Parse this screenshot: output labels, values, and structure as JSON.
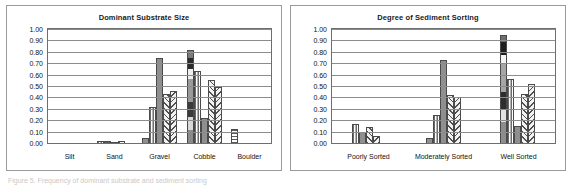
{
  "page": {
    "background_color": "#ffffff",
    "caption_partial": "Figure 5. Frequency of dominant substrate and sediment sorting"
  },
  "axis": {
    "ticks": [
      "1.00",
      "0.90",
      "0.80",
      "0.70",
      "0.60",
      "0.50",
      "0.40",
      "0.30",
      "0.20",
      "0.10",
      "0.00"
    ],
    "ymin": 0.0,
    "ymax": 1.0,
    "step": 0.1,
    "grid": true
  },
  "colors": {
    "frame": "#9a9a9a",
    "plot_border": "#6e6e6e",
    "gridline": "#8c8c8c",
    "bar_outline": "#4a4a4a",
    "text": "#111111"
  },
  "chart_data": [
    {
      "type": "bar",
      "panel": "left",
      "title": "Dominant Substrate Size",
      "xlabel": "",
      "ylabel": "",
      "ylim": [
        0,
        1.0
      ],
      "ytick_labels": [
        "1.00",
        "0.90",
        "0.80",
        "0.70",
        "0.60",
        "0.50",
        "0.40",
        "0.30",
        "0.20",
        "0.10",
        "0.00"
      ],
      "grid": true,
      "legend": "none",
      "categories": [
        "Silt",
        "Sand",
        "Gravel",
        "Cobble",
        "Boulder"
      ],
      "groups": [
        {
          "category": "Silt",
          "bars": [
            {
              "value": 0.0,
              "pattern": "p-solid"
            },
            {
              "value": 0.0,
              "pattern": "p-vstripe"
            },
            {
              "value": 0.0,
              "pattern": "p-diagR"
            },
            {
              "value": 0.0,
              "pattern": "p-diagL"
            },
            {
              "value": 0.0,
              "pattern": "p-solid"
            }
          ]
        },
        {
          "category": "Sand",
          "bars": [
            {
              "value": 0.015,
              "pattern": "p-vstripe"
            },
            {
              "value": 0.015,
              "pattern": "p-hstripe"
            },
            {
              "value": 0.01,
              "pattern": "p-solid"
            },
            {
              "value": 0.015,
              "pattern": "p-diagR"
            },
            {
              "value": 0.0,
              "pattern": "p-solid"
            }
          ]
        },
        {
          "category": "Gravel",
          "bars": [
            {
              "value": 0.04,
              "pattern": "p-solid"
            },
            {
              "value": 0.32,
              "pattern": "p-vstripe"
            },
            {
              "value": 0.75,
              "pattern": "p-solid"
            },
            {
              "value": 0.43,
              "pattern": "p-diagR"
            },
            {
              "value": 0.46,
              "pattern": "p-diagL"
            }
          ]
        },
        {
          "category": "Cobble",
          "bars": [
            {
              "value": 0.82,
              "pattern": "p-grad"
            },
            {
              "value": 0.63,
              "pattern": "p-vstripe"
            },
            {
              "value": 0.22,
              "pattern": "p-solid"
            },
            {
              "value": 0.55,
              "pattern": "p-diagR"
            },
            {
              "value": 0.49,
              "pattern": "p-diagL"
            }
          ]
        },
        {
          "category": "Boulder",
          "bars": [
            {
              "value": 0.12,
              "pattern": "p-hstripe"
            },
            {
              "value": 0.005,
              "pattern": "p-solid"
            },
            {
              "value": 0.0,
              "pattern": "p-diagR"
            },
            {
              "value": 0.0,
              "pattern": "p-diagL"
            },
            {
              "value": 0.0,
              "pattern": "p-solid"
            }
          ]
        }
      ]
    },
    {
      "type": "bar",
      "panel": "right",
      "title": "Degree of Sediment Sorting",
      "xlabel": "",
      "ylabel": "",
      "ylim": [
        0,
        1.0
      ],
      "ytick_labels": [
        "1.00",
        "0.90",
        "0.80",
        "0.70",
        "0.60",
        "0.50",
        "0.40",
        "0.30",
        "0.20",
        "0.10",
        "0.00"
      ],
      "grid": true,
      "legend": "none",
      "categories": [
        "Poorly Sorted",
        "Moderately Sorted",
        "Well Sorted"
      ],
      "groups": [
        {
          "category": "Poorly Sorted",
          "bars": [
            {
              "value": 0.17,
              "pattern": "p-vstripe"
            },
            {
              "value": 0.1,
              "pattern": "p-solid"
            },
            {
              "value": 0.14,
              "pattern": "p-diagR"
            },
            {
              "value": 0.06,
              "pattern": "p-diagL"
            },
            {
              "value": 0.0,
              "pattern": "p-solid"
            }
          ]
        },
        {
          "category": "Moderately Sorted",
          "bars": [
            {
              "value": 0.04,
              "pattern": "p-solid"
            },
            {
              "value": 0.25,
              "pattern": "p-vstripe"
            },
            {
              "value": 0.73,
              "pattern": "p-solid"
            },
            {
              "value": 0.42,
              "pattern": "p-diagR"
            },
            {
              "value": 0.4,
              "pattern": "p-diagL"
            }
          ]
        },
        {
          "category": "Well Sorted",
          "bars": [
            {
              "value": 0.95,
              "pattern": "p-grad2"
            },
            {
              "value": 0.56,
              "pattern": "p-vstripe"
            },
            {
              "value": 0.15,
              "pattern": "p-solid"
            },
            {
              "value": 0.43,
              "pattern": "p-diagR"
            },
            {
              "value": 0.52,
              "pattern": "p-diagL"
            }
          ]
        }
      ]
    }
  ]
}
